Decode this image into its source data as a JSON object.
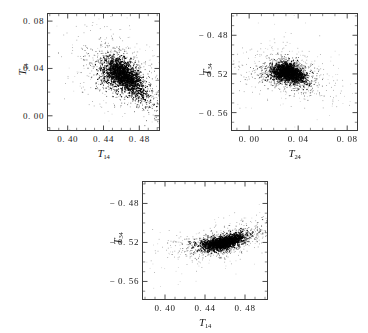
{
  "figure": {
    "width": 368,
    "height": 333,
    "background": "#ffffff",
    "frame_color": "#3a3a3a",
    "point_color": "#000000"
  },
  "chart_data": [
    {
      "type": "scatter",
      "panel": "a",
      "tag": "(a)",
      "title": "",
      "xlabel": "T",
      "xlabel_sub": "14",
      "ylabel": "T",
      "ylabel_sub": "24",
      "xlim": [
        0.378,
        0.502
      ],
      "ylim": [
        -0.012,
        0.086
      ],
      "xticks": [
        0.4,
        0.44,
        0.48
      ],
      "xtick_labels": [
        "0. 40",
        "0. 44",
        "0. 48"
      ],
      "yticks": [
        0.0,
        0.04,
        0.08
      ],
      "ytick_labels": [
        "0. 00",
        "0. 04",
        "0. 08"
      ],
      "grid": false,
      "legend": "none",
      "cloud": {
        "n_points": 2600,
        "center_x": 0.462,
        "center_y": 0.034,
        "spread_x": 0.018,
        "spread_y": 0.012,
        "correlation": -0.55,
        "halo_scale": 2.0,
        "seed": 17
      }
    },
    {
      "type": "scatter",
      "panel": "b",
      "tag": "(b)",
      "title": "",
      "xlabel": "T",
      "xlabel_sub": "24",
      "ylabel": "T",
      "ylabel_sub": "34",
      "xlim": [
        -0.014,
        0.088
      ],
      "ylim": [
        -0.578,
        -0.458
      ],
      "xticks": [
        0.0,
        0.04,
        0.08
      ],
      "xtick_labels": [
        "0. 00",
        "0. 04",
        "0. 08"
      ],
      "yticks": [
        -0.56,
        -0.52,
        -0.48
      ],
      "ytick_labels": [
        "− 0. 56",
        "− 0. 52",
        "− 0. 48"
      ],
      "grid": false,
      "legend": "none",
      "cloud": {
        "n_points": 2600,
        "center_x": 0.0315,
        "center_y": -0.5185,
        "spread_x": 0.0105,
        "spread_y": 0.0075,
        "correlation": -0.3,
        "halo_scale": 2.3,
        "seed": 41
      }
    },
    {
      "type": "scatter",
      "panel": "c",
      "tag": "(c)",
      "title": "",
      "xlabel": "T",
      "xlabel_sub": "14",
      "ylabel": "T",
      "ylabel_sub": "34",
      "xlim": [
        0.378,
        0.502
      ],
      "ylim": [
        -0.578,
        -0.458
      ],
      "xticks": [
        0.4,
        0.44,
        0.48
      ],
      "xtick_labels": [
        "0. 40",
        "0. 44",
        "0. 48"
      ],
      "yticks": [
        -0.56,
        -0.52,
        -0.48
      ],
      "ytick_labels": [
        "− 0. 56",
        "− 0. 52",
        "− 0. 48"
      ],
      "grid": false,
      "legend": "none",
      "cloud": {
        "n_points": 2600,
        "center_x": 0.458,
        "center_y": -0.5195,
        "spread_x": 0.017,
        "spread_y": 0.0065,
        "correlation": 0.62,
        "halo_scale": 2.2,
        "seed": 83
      }
    }
  ],
  "layout": {
    "panels": [
      {
        "id": "a",
        "frame_left": 47,
        "frame_top": 13,
        "frame_width": 113,
        "frame_height": 118
      },
      {
        "id": "b",
        "frame_left": 231,
        "frame_top": 13,
        "frame_width": 127,
        "frame_height": 118
      },
      {
        "id": "c",
        "frame_left": 142,
        "frame_top": 181,
        "frame_width": 126,
        "frame_height": 119
      }
    ]
  }
}
